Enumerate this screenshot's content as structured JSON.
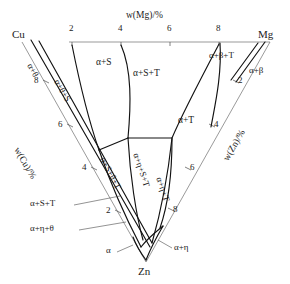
{
  "diagram": {
    "type": "ternary-phase-diagram",
    "corners": [
      {
        "id": "cu",
        "label": "Cu",
        "x": 22,
        "y": 36
      },
      {
        "id": "mg",
        "label": "Mg",
        "x": 268,
        "y": 36
      },
      {
        "id": "zn",
        "label": "Zn",
        "x": 146,
        "y": 272
      }
    ],
    "axes": [
      {
        "id": "top-axis",
        "label": "w(Mg)/%",
        "label_x": 150,
        "label_y": 17,
        "ticks": [
          {
            "value": "2",
            "x": 72,
            "y": 32
          },
          {
            "value": "4",
            "x": 121,
            "y": 32
          },
          {
            "value": "6",
            "x": 170,
            "y": 32
          },
          {
            "value": "8",
            "x": 219,
            "y": 32
          }
        ]
      },
      {
        "id": "left-axis",
        "label": "w(Cu)/%",
        "label_x": 38,
        "label_y": 152,
        "label_rotate": 62,
        "ticks": [
          {
            "value": "8",
            "x": 36,
            "y": 82
          },
          {
            "value": "6",
            "x": 60,
            "y": 126
          },
          {
            "value": "4",
            "x": 84,
            "y": 170
          },
          {
            "value": "2",
            "x": 108,
            "y": 213
          }
        ]
      },
      {
        "id": "right-axis",
        "label": "w(Zn)/%",
        "label_x": 222,
        "label_y": 153,
        "label_rotate": -62,
        "ticks": [
          {
            "value": "2",
            "x": 237,
            "y": 82
          },
          {
            "value": "4",
            "x": 212,
            "y": 126
          },
          {
            "value": "6",
            "x": 189,
            "y": 170
          },
          {
            "value": "8",
            "x": 175,
            "y": 211
          }
        ]
      }
    ],
    "phase_regions": [
      {
        "id": "a-theta",
        "label": "α+θ",
        "x": 44,
        "y": 70,
        "rotate": 62
      },
      {
        "id": "a-theta-s",
        "label": "α+θ+S",
        "x": 71,
        "y": 88,
        "rotate": 62
      },
      {
        "id": "a-s",
        "label": "α+S",
        "x": 110,
        "y": 65,
        "rotate": 0
      },
      {
        "id": "a-s-t",
        "label": "α+S+T",
        "x": 152,
        "y": 75,
        "rotate": 0
      },
      {
        "id": "a-beta-t",
        "label": "α+β+T",
        "x": 228,
        "y": 57,
        "rotate": 0
      },
      {
        "id": "a-beta",
        "label": "α+β",
        "x": 260,
        "y": 72,
        "rotate": 0
      },
      {
        "id": "a-t",
        "label": "α+T",
        "x": 190,
        "y": 122,
        "rotate": 0
      },
      {
        "id": "a-s-theta-t",
        "label": "α+S+θ+T",
        "x": 115,
        "y": 172,
        "rotate": 62
      },
      {
        "id": "a-eta-s-t",
        "label": "α+η+S+T",
        "x": 148,
        "y": 172,
        "rotate": 72
      },
      {
        "id": "a-eta-t",
        "label": "α+η+T",
        "x": 170,
        "y": 195,
        "rotate": 72
      },
      {
        "id": "a-s-t-leader",
        "label": "α+S+T",
        "x": 46,
        "y": 205,
        "rotate": 0
      },
      {
        "id": "a-eta-theta",
        "label": "α+η+θ",
        "x": 46,
        "y": 230,
        "rotate": 0
      },
      {
        "id": "alpha",
        "label": "α",
        "x": 110,
        "y": 253,
        "rotate": 0
      },
      {
        "id": "a-eta",
        "label": "α+η",
        "x": 175,
        "y": 250,
        "rotate": 0
      }
    ]
  }
}
